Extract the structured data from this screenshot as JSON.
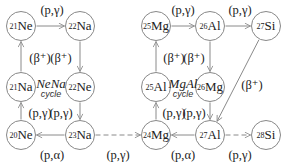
{
  "nodes": [
    {
      "id": "ne21",
      "mass": "21",
      "el": "Ne",
      "x": 21,
      "y": 26
    },
    {
      "id": "na22",
      "mass": "22",
      "el": "Na",
      "x": 80,
      "y": 26
    },
    {
      "id": "na21",
      "mass": "21",
      "el": "Na",
      "x": 21,
      "y": 87
    },
    {
      "id": "ne22",
      "mass": "22",
      "el": "Ne",
      "x": 80,
      "y": 87
    },
    {
      "id": "ne20",
      "mass": "20",
      "el": "Ne",
      "x": 21,
      "y": 135
    },
    {
      "id": "na23",
      "mass": "23",
      "el": "Na",
      "x": 80,
      "y": 135
    },
    {
      "id": "mg25",
      "mass": "25",
      "el": "Mg",
      "x": 156,
      "y": 26
    },
    {
      "id": "al26",
      "mass": "26",
      "el": "Al",
      "x": 210,
      "y": 26
    },
    {
      "id": "si27",
      "mass": "27",
      "el": "Si",
      "x": 266,
      "y": 26
    },
    {
      "id": "al25",
      "mass": "25",
      "el": "Al",
      "x": 156,
      "y": 87
    },
    {
      "id": "mg26",
      "mass": "26",
      "el": "Mg",
      "x": 210,
      "y": 87
    },
    {
      "id": "mg24",
      "mass": "24",
      "el": "Mg",
      "x": 156,
      "y": 135
    },
    {
      "id": "al27",
      "mass": "27",
      "el": "Al",
      "x": 210,
      "y": 135
    },
    {
      "id": "si28",
      "mass": "28",
      "el": "Si",
      "x": 266,
      "y": 135
    }
  ],
  "labels": [
    {
      "text": "(p,γ)",
      "x": 52,
      "y": 10
    },
    {
      "text": "(β⁺)",
      "x": 40,
      "y": 58
    },
    {
      "text": "(β⁺)",
      "x": 61,
      "y": 58
    },
    {
      "text": "(p,γ)",
      "x": 40,
      "y": 113
    },
    {
      "text": "(p,γ)",
      "x": 61,
      "y": 113
    },
    {
      "text": "(p,α)",
      "x": 52,
      "y": 155
    },
    {
      "text": "(p,γ)",
      "x": 118,
      "y": 155
    },
    {
      "text": "(p,γ)",
      "x": 183,
      "y": 10
    },
    {
      "text": "(p,γ)",
      "x": 240,
      "y": 10
    },
    {
      "text": "(β⁺)",
      "x": 174,
      "y": 58
    },
    {
      "text": "(β⁺)",
      "x": 194,
      "y": 58
    },
    {
      "text": "(β⁺)",
      "x": 252,
      "y": 85
    },
    {
      "text": "(p,γ)",
      "x": 174,
      "y": 113
    },
    {
      "text": "(p,γ)",
      "x": 194,
      "y": 113
    },
    {
      "text": "(p,α)",
      "x": 183,
      "y": 155
    },
    {
      "text": "(p,γ)",
      "x": 240,
      "y": 155
    }
  ],
  "cycles": [
    {
      "title": "NeNa",
      "subtitle": "cycle",
      "x": 51,
      "y": 89
    },
    {
      "title": "MgAl",
      "subtitle": "cycle",
      "x": 183,
      "y": 89
    }
  ],
  "edges": [
    {
      "from": "ne21",
      "to": "na22",
      "style": "solid"
    },
    {
      "from": "na22",
      "to": "ne22",
      "style": "solid"
    },
    {
      "from": "na21",
      "to": "ne21",
      "style": "solid"
    },
    {
      "from": "ne22",
      "to": "na23",
      "style": "solid"
    },
    {
      "from": "ne20",
      "to": "na21",
      "style": "solid"
    },
    {
      "from": "na23",
      "to": "ne20",
      "style": "solid"
    },
    {
      "from": "na23",
      "to": "mg24",
      "style": "dashed"
    },
    {
      "from": "mg25",
      "to": "al26",
      "style": "solid"
    },
    {
      "from": "al26",
      "to": "si27",
      "style": "solid"
    },
    {
      "from": "al26",
      "to": "mg26",
      "style": "solid"
    },
    {
      "from": "al25",
      "to": "mg25",
      "style": "solid"
    },
    {
      "from": "mg26",
      "to": "al27",
      "style": "solid"
    },
    {
      "from": "mg24",
      "to": "al25",
      "style": "solid"
    },
    {
      "from": "si27",
      "to": "al27",
      "style": "solid"
    },
    {
      "from": "al27",
      "to": "mg24",
      "style": "solid"
    },
    {
      "from": "al27",
      "to": "si28",
      "style": "dashed"
    }
  ],
  "colors": {
    "line": "#8a8a8a",
    "node_border": "#888888",
    "text": "#222222"
  }
}
